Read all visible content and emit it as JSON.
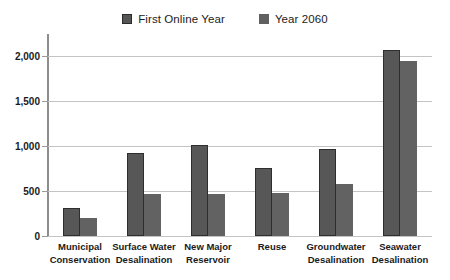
{
  "chart_data": {
    "type": "bar",
    "title": "",
    "xlabel": "",
    "ylabel": "",
    "ylim": [
      0,
      2250
    ],
    "ytick_values": [
      0,
      500,
      1000,
      1500,
      2000
    ],
    "ytick_labels": [
      "0",
      "500",
      "1,000",
      "1,500",
      "2,000"
    ],
    "grid": true,
    "legend_position": "top-center",
    "categories": [
      "Municipal Conservation",
      "Surface Water Desalination",
      "New Major Reservoir",
      "Reuse",
      "Groundwater Desalination",
      "Seawater Desalination"
    ],
    "category_lines": [
      [
        "Municipal",
        "Conservation"
      ],
      [
        "Surface Water",
        "Desalination"
      ],
      [
        "New Major",
        "Reservoir"
      ],
      [
        "Reuse",
        ""
      ],
      [
        "Groundwater",
        "Desalination"
      ],
      [
        "Seawater",
        "Desalination"
      ]
    ],
    "series": [
      {
        "name": "First Online Year",
        "color": "#575757",
        "border_color": "#2e2e2e",
        "values": [
          310,
          920,
          1015,
          755,
          965,
          2070
        ]
      },
      {
        "name": "Year 2060",
        "color": "#626262",
        "border_color": "none",
        "values": [
          205,
          470,
          470,
          480,
          575,
          1950
        ]
      }
    ]
  },
  "legend": {
    "entries": [
      {
        "label": "First Online Year",
        "swatch_class": "s1"
      },
      {
        "label": "Year 2060",
        "swatch_class": "s2"
      }
    ]
  },
  "colors": {
    "series1": "#575757",
    "series2": "#626262",
    "gridline": "#c4c4c4",
    "axis": "#8d8d8d",
    "text": "#1b1b1b",
    "background": "#ffffff"
  }
}
